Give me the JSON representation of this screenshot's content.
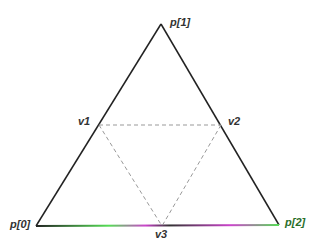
{
  "diagram": {
    "type": "triangle-subdivision",
    "points": {
      "p0": {
        "label": "p[0]",
        "x": 36,
        "y": 226
      },
      "p1": {
        "label": "p[1]",
        "x": 161,
        "y": 24
      },
      "p2": {
        "label": "p[2]",
        "x": 279,
        "y": 225
      },
      "v1": {
        "label": "v1",
        "x": 99,
        "y": 125
      },
      "v2": {
        "label": "v2",
        "x": 221,
        "y": 125
      },
      "v3": {
        "label": "v3",
        "x": 162,
        "y": 226
      }
    },
    "colors": {
      "outer_edge": "#222222",
      "inner_dashed": "#999999",
      "label": "#333333",
      "p2_label": "#2a6e2a"
    }
  }
}
